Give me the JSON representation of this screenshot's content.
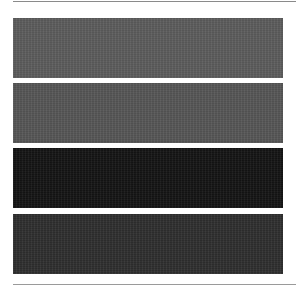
{
  "swatches": [
    {
      "name": "swatch-1",
      "color": "#5c5c5c"
    },
    {
      "name": "swatch-2",
      "color": "#565656"
    },
    {
      "name": "swatch-3",
      "color": "#141414"
    },
    {
      "name": "swatch-4",
      "color": "#2e2e2e"
    }
  ]
}
